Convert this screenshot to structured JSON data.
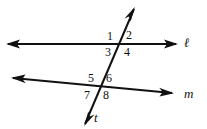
{
  "figure": {
    "background_color": "#ffffff",
    "stroke_color": "#111111",
    "text_color": "#111111"
  },
  "lines": [
    {
      "id": "line-l",
      "label": "ℓ",
      "label_name": "line-label-l",
      "label_x": 184,
      "label_y": 36,
      "x1": 8,
      "y1": 44,
      "x2": 176,
      "y2": 44,
      "arrow_start": true,
      "arrow_end": true
    },
    {
      "id": "line-m",
      "label": "m",
      "label_name": "line-label-m",
      "label_x": 184,
      "label_y": 87,
      "x1": 13,
      "y1": 78,
      "x2": 172,
      "y2": 93,
      "arrow_start": true,
      "arrow_end": true
    },
    {
      "id": "line-t",
      "label": "t",
      "label_name": "line-label-t",
      "label_x": 94,
      "label_y": 111,
      "x1": 85,
      "y1": 124,
      "x2": 134,
      "y2": 9,
      "arrow_start": true,
      "arrow_end": true
    }
  ],
  "intersections": [
    {
      "id": "intersection-top",
      "x": 119,
      "y": 44,
      "lines": [
        "line-l",
        "line-t"
      ]
    },
    {
      "id": "intersection-bottom",
      "x": 100,
      "y": 86,
      "lines": [
        "line-m",
        "line-t"
      ]
    }
  ],
  "angle_labels": [
    {
      "id": "angle-1",
      "text": "1",
      "x": 107,
      "y": 30,
      "position": "upper-left",
      "intersection": "intersection-top"
    },
    {
      "id": "angle-2",
      "text": "2",
      "x": 126,
      "y": 29,
      "position": "upper-right",
      "intersection": "intersection-top"
    },
    {
      "id": "angle-3",
      "text": "3",
      "x": 105,
      "y": 46,
      "position": "lower-left",
      "intersection": "intersection-top"
    },
    {
      "id": "angle-4",
      "text": "4",
      "x": 124,
      "y": 46,
      "position": "lower-right",
      "intersection": "intersection-top"
    },
    {
      "id": "angle-5",
      "text": "5",
      "x": 88,
      "y": 72,
      "position": "upper-left",
      "intersection": "intersection-bottom"
    },
    {
      "id": "angle-6",
      "text": "6",
      "x": 106,
      "y": 72,
      "position": "upper-right",
      "intersection": "intersection-bottom"
    },
    {
      "id": "angle-7",
      "text": "7",
      "x": 84,
      "y": 89,
      "position": "lower-left",
      "intersection": "intersection-bottom"
    },
    {
      "id": "angle-8",
      "text": "8",
      "x": 103,
      "y": 89,
      "position": "lower-right",
      "intersection": "intersection-bottom"
    }
  ]
}
